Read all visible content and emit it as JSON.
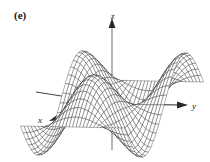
{
  "figure": {
    "panel_label": "(e)",
    "background_color": "#ffffff",
    "ink_color": "#1a1a1a",
    "width": 210,
    "height": 162
  },
  "axes": {
    "z": {
      "label": "z",
      "name": "z-axis",
      "direction": "up",
      "arrow": true
    },
    "y": {
      "label": "y",
      "name": "y-axis",
      "direction": "right",
      "arrow": true
    },
    "x": {
      "label": "x",
      "name": "x-axis",
      "direction": "down-left",
      "arrow": true
    }
  },
  "chart_data": {
    "type": "surface",
    "title": "(e)",
    "xlabel": "x",
    "ylabel": "y",
    "zlabel": "z",
    "surface_function": "z = sin(u) * cos(v) style saddle / monkey-saddle wireframe",
    "u_range": [
      -3.14159,
      3.14159
    ],
    "v_range": [
      -3.14159,
      3.14159
    ],
    "u_steps": 30,
    "v_steps": 30,
    "projection": {
      "type": "oblique-3d",
      "origin_px": [
        112,
        104
      ],
      "x_axis_vector_px": [
        -0.86,
        0.5
      ],
      "y_axis_vector_px": [
        1.0,
        0.02
      ],
      "z_axis_vector_px": [
        0,
        -1.0
      ],
      "x_scale": 46,
      "y_scale": 52,
      "z_scale": 40
    },
    "grid": true,
    "legend": null,
    "mesh_line_color": "#1a1a1a",
    "mesh_fill_color": "#ffffff"
  }
}
